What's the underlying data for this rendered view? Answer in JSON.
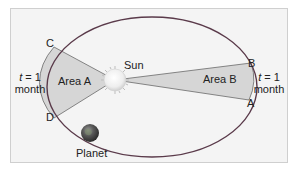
{
  "diagram": {
    "labels": {
      "sun": "Sun",
      "planet": "Planet",
      "area_a": "Area A",
      "area_b": "Area B",
      "point_a": "A",
      "point_b": "B",
      "point_c": "C",
      "point_d": "D"
    },
    "left_time": {
      "t": "t",
      "eq": " = 1",
      "unit": "month"
    },
    "right_time": {
      "t": "t",
      "eq": " = 1",
      "unit": "month"
    },
    "colors": {
      "background": "#f4f4f4",
      "border": "#cfcfcf",
      "orbit": "#5a3a4a",
      "wedge_fill": "#d6d6d6",
      "wedge_stroke": "#6a6a6a",
      "sun": "#f2f2f2",
      "planet": "#4c4c4c"
    }
  }
}
